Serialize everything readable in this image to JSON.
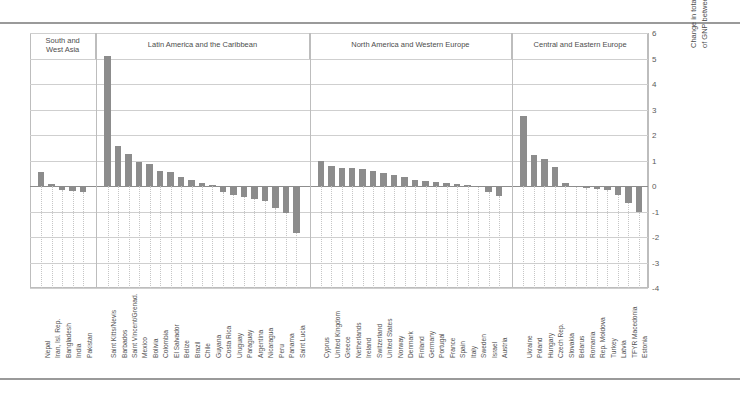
{
  "chart_data": {
    "type": "bar",
    "title": "Change in total public expenditure on education as % of GNP between 1999 and 2005 (percentage points)",
    "ylabel_line1": "Change in total public expenditure on education as %",
    "ylabel_line2": "of GNP between 1999 and 2005 (percentage points)",
    "xlabel": "",
    "ylim": [
      -4,
      6
    ],
    "yticks": [
      6,
      5,
      4,
      3,
      2,
      1,
      0,
      -1,
      -2,
      -3,
      -4
    ],
    "grid": true,
    "legend": "none",
    "bar_color": "#8c8c8c",
    "groups": [
      {
        "label": "South and\nWest Asia",
        "label_line1": "South and",
        "label_line2": "West Asia",
        "categories": [
          "Nepal",
          "Iran, Isl. Rep.",
          "Bangladesh",
          "India",
          "Pakistan"
        ],
        "values": [
          0.55,
          0.08,
          -0.15,
          -0.2,
          -0.22
        ]
      },
      {
        "label": "Latin America and the Caribbean",
        "label_line1": "Latin America and the Caribbean",
        "label_line2": "",
        "categories": [
          "Saint Kitts/Nevis",
          "Barbados",
          "Saint Vincent/Grenad.",
          "Mexico",
          "Bolivia",
          "Colombia",
          "El Salvador",
          "Belize",
          "Brazil",
          "Chile",
          "Guyana",
          "Costa Rica",
          "Uruguay",
          "Paraguay",
          "Argentina",
          "Nicaragua",
          "Peru",
          "Panama",
          "Saint Lucia"
        ],
        "values": [
          5.1,
          1.55,
          1.25,
          0.95,
          0.85,
          0.58,
          0.55,
          0.35,
          0.25,
          0.1,
          0.05,
          -0.22,
          -0.35,
          -0.45,
          -0.5,
          -0.6,
          -0.85,
          -1.05,
          -1.85
        ]
      },
      {
        "label": "North America and Western Europe",
        "label_line1": "North America and Western Europe",
        "label_line2": "",
        "categories": [
          "Cyprus",
          "United Kingdom",
          "Greece",
          "Netherlands",
          "Ireland",
          "Switzerland",
          "United States",
          "Norway",
          "Denmark",
          "Finland",
          "Germany",
          "Portugal",
          "France",
          "Spain",
          "Italy",
          "Sweden",
          "Israel",
          "Austria"
        ],
        "values": [
          1.0,
          0.78,
          0.72,
          0.7,
          0.68,
          0.6,
          0.5,
          0.42,
          0.35,
          0.25,
          0.2,
          0.15,
          0.12,
          0.08,
          0.05,
          -0.05,
          -0.25,
          -0.4
        ]
      },
      {
        "label": "Central and Eastern Europe",
        "label_line1": "Central and Eastern Europe",
        "label_line2": "",
        "categories": [
          "Ukraine",
          "Poland",
          "Hungary",
          "Czech Rep.",
          "Slovakia",
          "Belarus",
          "Romania",
          "Rep. Moldova",
          "Turkey",
          "Latvia",
          "TFYR Macedonia",
          "Estonia"
        ],
        "values": [
          2.75,
          1.2,
          1.05,
          0.75,
          0.12,
          -0.05,
          -0.08,
          -0.1,
          -0.15,
          -0.35,
          -0.65,
          -1.0
        ]
      }
    ]
  }
}
